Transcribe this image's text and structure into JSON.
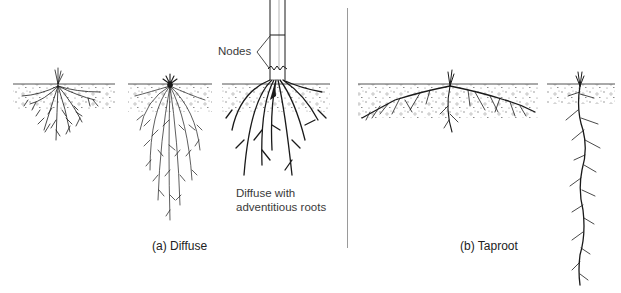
{
  "figure": {
    "panels": [
      {
        "id": "a",
        "caption": "(a) Diffuse",
        "examples": [
          {
            "name": "shallow-fibrous-root",
            "description": "shallow diffuse root system"
          },
          {
            "name": "deep-fibrous-root",
            "description": "deep diffuse root system"
          },
          {
            "name": "adventitious-root",
            "annotation_lines": [
              "Diffuse with",
              "adventitious roots"
            ],
            "callout": "Nodes"
          }
        ]
      },
      {
        "id": "b",
        "caption": "(b) Taproot",
        "examples": [
          {
            "name": "shallow-spreading-taproot",
            "description": "shallow spreading taproot"
          },
          {
            "name": "deep-taproot",
            "description": "deep vertical taproot"
          }
        ]
      }
    ],
    "colors": {
      "ink": "#1a1a1a",
      "soil_line": "#555555",
      "soil_speckle": "#666666",
      "divider": "#9a9a9a",
      "text": "#333333",
      "background": "#ffffff"
    }
  }
}
